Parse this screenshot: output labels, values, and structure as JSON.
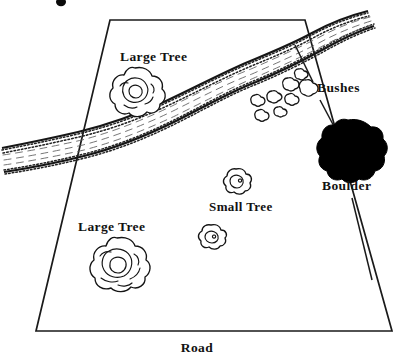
{
  "figure": {
    "kind": "site-sketch-map",
    "background_color": "#ffffff",
    "ink_color": "#141414",
    "boulder_fill": "#000000"
  },
  "plot": {
    "name": "property-boundary",
    "shape": "trapezoid",
    "corners": [
      {
        "label": "top-left",
        "x": 110,
        "y": 20
      },
      {
        "label": "top-right",
        "x": 305,
        "y": 20
      },
      {
        "label": "bottom-right",
        "x": 392,
        "y": 331
      },
      {
        "label": "bottom-left",
        "x": 36,
        "y": 331
      }
    ]
  },
  "labels": {
    "large_tree_upper": "Large Tree",
    "large_tree_lower": "Large Tree",
    "small_tree": "Small Tree",
    "bushes": "Bushes",
    "boulder": "Boulder",
    "road": "Road"
  },
  "features": [
    {
      "id": "large-tree-upper",
      "type": "large-tree",
      "label": "Large Tree",
      "label_x": 120,
      "label_y": 61,
      "x": 135,
      "y": 93,
      "radius": 25
    },
    {
      "id": "large-tree-lower",
      "type": "large-tree",
      "label": "Large Tree",
      "label_x": 78,
      "label_y": 231,
      "x": 117,
      "y": 265,
      "radius": 27
    },
    {
      "id": "small-tree-upper",
      "type": "small-tree",
      "label": "Small Tree",
      "label_x": 209,
      "label_y": 211,
      "x": 236,
      "y": 181,
      "radius": 13
    },
    {
      "id": "small-tree-lower",
      "type": "small-tree",
      "label": "",
      "x": 211,
      "y": 236,
      "radius": 12
    },
    {
      "id": "boulder",
      "type": "boulder",
      "label": "Boulder",
      "label_x": 322,
      "label_y": 190,
      "x": 348,
      "y": 150,
      "radius": 30
    }
  ],
  "bushes": {
    "label": "Bushes",
    "label_x": 317,
    "label_y": 92,
    "count": 8,
    "cluster": [
      {
        "x": 291,
        "y": 84,
        "r": 7.5
      },
      {
        "x": 309,
        "y": 88,
        "r": 8.5
      },
      {
        "x": 276,
        "y": 97,
        "r": 7
      },
      {
        "x": 292,
        "y": 99,
        "r": 6.5
      },
      {
        "x": 258,
        "y": 100,
        "r": 6.5
      },
      {
        "x": 281,
        "y": 112,
        "r": 6
      },
      {
        "x": 262,
        "y": 115,
        "r": 6.5
      },
      {
        "x": 299,
        "y": 74,
        "r": 5.5
      }
    ]
  },
  "leaders": [
    {
      "id": "bushes-leader",
      "from_x": 313,
      "from_y": 82,
      "to_x": 295,
      "to_y": 45
    },
    {
      "id": "boulder-leader",
      "from_x": 320,
      "from_y": 100,
      "to_x": 337,
      "to_y": 132
    },
    {
      "id": "road-leader",
      "from_x": 352,
      "from_y": 198,
      "to_x": 372,
      "to_y": 280
    }
  ],
  "stream": {
    "name": "creek",
    "enters": "left-edge",
    "exits": "top-right",
    "style": "stippled-banks-with-dashed-flow-lines"
  },
  "road": {
    "label": "Road",
    "label_x": 197,
    "label_y": 350,
    "position": "below-bottom-boundary"
  },
  "artifact": {
    "name": "ink-speck",
    "x": 61,
    "y": 2,
    "rx": 5,
    "ry": 4
  }
}
